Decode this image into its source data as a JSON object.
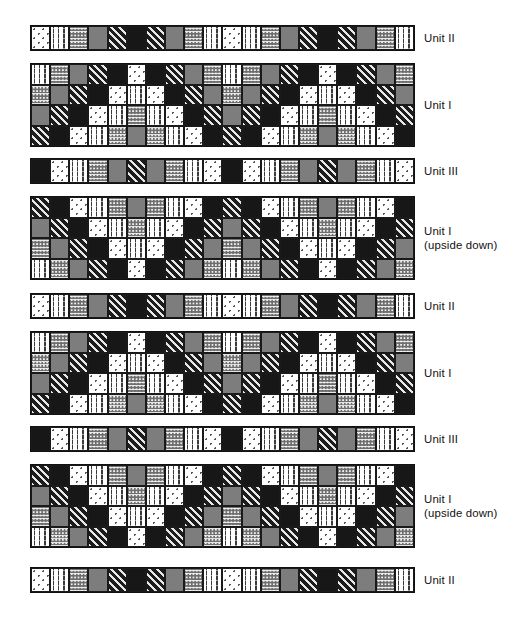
{
  "figure": {
    "title": "",
    "background_color": "#ffffff",
    "band_border_color": "#111111"
  },
  "legend": {
    "patterns": [
      {
        "key": "dotw",
        "name": "white-with-dots",
        "color": "#ffffff"
      },
      {
        "key": "wave",
        "name": "white-with-wavy-lines",
        "color": "#ffffff"
      },
      {
        "key": "dotd",
        "name": "dark-stipple-dots",
        "color": "#6e6e6e"
      },
      {
        "key": "gray",
        "name": "solid-gray",
        "color": "#7d7d7d"
      },
      {
        "key": "diag",
        "name": "dark-diagonal-stripes",
        "color": "#1c1c1c"
      },
      {
        "key": "blk",
        "name": "solid-black",
        "color": "#171717"
      }
    ]
  },
  "layout": {
    "band_left": 30,
    "band_width": 385,
    "label_left": 424,
    "cell_size": 19.25,
    "columns": 20
  },
  "bands": [
    {
      "id": "band-1",
      "label": "Unit II",
      "label_lines": "Unit II",
      "rows": 1,
      "top": 25,
      "height": 26,
      "grid": [
        [
          "dotw",
          "wave",
          "dotd",
          "gray",
          "diag",
          "blk",
          "diag",
          "gray",
          "dotd",
          "wave",
          "dotw",
          "wave",
          "dotd",
          "gray",
          "diag",
          "blk",
          "diag",
          "gray",
          "dotd",
          "wave"
        ]
      ]
    },
    {
      "id": "band-2",
      "label": "Unit I",
      "label_lines": "Unit I",
      "rows": 4,
      "top": 63,
      "height": 84,
      "grid": [
        [
          "wave",
          "dotd",
          "gray",
          "diag",
          "blk",
          "dotw",
          "blk",
          "diag",
          "gray",
          "dotd",
          "wave",
          "dotd",
          "gray",
          "diag",
          "blk",
          "dotw",
          "blk",
          "diag",
          "gray",
          "dotd"
        ],
        [
          "dotd",
          "gray",
          "diag",
          "blk",
          "dotw",
          "wave",
          "dotw",
          "blk",
          "diag",
          "gray",
          "dotd",
          "gray",
          "diag",
          "blk",
          "dotw",
          "wave",
          "dotw",
          "blk",
          "diag",
          "gray"
        ],
        [
          "gray",
          "diag",
          "blk",
          "dotw",
          "wave",
          "dotd",
          "wave",
          "dotw",
          "blk",
          "diag",
          "gray",
          "diag",
          "blk",
          "dotw",
          "wave",
          "dotd",
          "wave",
          "dotw",
          "blk",
          "diag"
        ],
        [
          "diag",
          "blk",
          "dotw",
          "wave",
          "dotd",
          "gray",
          "dotd",
          "wave",
          "dotw",
          "blk",
          "diag",
          "blk",
          "dotw",
          "wave",
          "dotd",
          "gray",
          "dotd",
          "wave",
          "dotw",
          "blk"
        ]
      ]
    },
    {
      "id": "band-3",
      "label": "Unit III",
      "label_lines": "Unit III",
      "rows": 1,
      "top": 158,
      "height": 26,
      "grid": [
        [
          "blk",
          "dotw",
          "wave",
          "dotd",
          "gray",
          "diag",
          "gray",
          "dotd",
          "wave",
          "dotw",
          "blk",
          "dotw",
          "wave",
          "dotd",
          "gray",
          "diag",
          "gray",
          "dotd",
          "wave",
          "dotw"
        ]
      ]
    },
    {
      "id": "band-4",
      "label": "Unit I (upside down)",
      "label_lines": "Unit I\n(upside down)",
      "rows": 4,
      "top": 196,
      "height": 84,
      "grid": [
        [
          "diag",
          "blk",
          "dotw",
          "wave",
          "dotd",
          "gray",
          "dotd",
          "wave",
          "dotw",
          "blk",
          "diag",
          "blk",
          "dotw",
          "wave",
          "dotd",
          "gray",
          "dotd",
          "wave",
          "dotw",
          "blk"
        ],
        [
          "gray",
          "diag",
          "blk",
          "dotw",
          "wave",
          "dotd",
          "wave",
          "dotw",
          "blk",
          "diag",
          "gray",
          "diag",
          "blk",
          "dotw",
          "wave",
          "dotd",
          "wave",
          "dotw",
          "blk",
          "diag"
        ],
        [
          "dotd",
          "gray",
          "diag",
          "blk",
          "dotw",
          "wave",
          "dotw",
          "blk",
          "diag",
          "gray",
          "dotd",
          "gray",
          "diag",
          "blk",
          "dotw",
          "wave",
          "dotw",
          "blk",
          "diag",
          "gray"
        ],
        [
          "wave",
          "dotd",
          "gray",
          "diag",
          "blk",
          "dotw",
          "blk",
          "diag",
          "gray",
          "dotd",
          "wave",
          "dotd",
          "gray",
          "diag",
          "blk",
          "dotw",
          "blk",
          "diag",
          "gray",
          "dotd"
        ]
      ]
    },
    {
      "id": "band-5",
      "label": "Unit II",
      "label_lines": "Unit II",
      "rows": 1,
      "top": 293,
      "height": 26,
      "grid": [
        [
          "dotw",
          "wave",
          "dotd",
          "gray",
          "diag",
          "blk",
          "diag",
          "gray",
          "dotd",
          "wave",
          "dotw",
          "wave",
          "dotd",
          "gray",
          "diag",
          "blk",
          "diag",
          "gray",
          "dotd",
          "wave"
        ]
      ]
    },
    {
      "id": "band-6",
      "label": "Unit I",
      "label_lines": "Unit I",
      "rows": 4,
      "top": 331,
      "height": 84,
      "grid": [
        [
          "wave",
          "dotd",
          "gray",
          "diag",
          "blk",
          "dotw",
          "blk",
          "diag",
          "gray",
          "dotd",
          "wave",
          "dotd",
          "gray",
          "diag",
          "blk",
          "dotw",
          "blk",
          "diag",
          "gray",
          "dotd"
        ],
        [
          "dotd",
          "gray",
          "diag",
          "blk",
          "dotw",
          "wave",
          "dotw",
          "blk",
          "diag",
          "gray",
          "dotd",
          "gray",
          "diag",
          "blk",
          "dotw",
          "wave",
          "dotw",
          "blk",
          "diag",
          "gray"
        ],
        [
          "gray",
          "diag",
          "blk",
          "dotw",
          "wave",
          "dotd",
          "wave",
          "dotw",
          "blk",
          "diag",
          "gray",
          "diag",
          "blk",
          "dotw",
          "wave",
          "dotd",
          "wave",
          "dotw",
          "blk",
          "diag"
        ],
        [
          "diag",
          "blk",
          "dotw",
          "wave",
          "dotd",
          "gray",
          "dotd",
          "wave",
          "dotw",
          "blk",
          "diag",
          "blk",
          "dotw",
          "wave",
          "dotd",
          "gray",
          "dotd",
          "wave",
          "dotw",
          "blk"
        ]
      ]
    },
    {
      "id": "band-7",
      "label": "Unit III",
      "label_lines": "Unit III",
      "rows": 1,
      "top": 426,
      "height": 26,
      "grid": [
        [
          "blk",
          "dotw",
          "wave",
          "dotd",
          "gray",
          "diag",
          "gray",
          "dotd",
          "wave",
          "dotw",
          "blk",
          "dotw",
          "wave",
          "dotd",
          "gray",
          "diag",
          "gray",
          "dotd",
          "wave",
          "dotw"
        ]
      ]
    },
    {
      "id": "band-8",
      "label": "Unit I (upside down)",
      "label_lines": "Unit I\n(upside down)",
      "rows": 4,
      "top": 464,
      "height": 84,
      "grid": [
        [
          "diag",
          "blk",
          "dotw",
          "wave",
          "dotd",
          "gray",
          "dotd",
          "wave",
          "dotw",
          "blk",
          "diag",
          "blk",
          "dotw",
          "wave",
          "dotd",
          "gray",
          "dotd",
          "wave",
          "dotw",
          "blk"
        ],
        [
          "gray",
          "diag",
          "blk",
          "dotw",
          "wave",
          "dotd",
          "wave",
          "dotw",
          "blk",
          "diag",
          "gray",
          "diag",
          "blk",
          "dotw",
          "wave",
          "dotd",
          "wave",
          "dotw",
          "blk",
          "diag"
        ],
        [
          "dotd",
          "gray",
          "diag",
          "blk",
          "dotw",
          "wave",
          "dotw",
          "blk",
          "diag",
          "gray",
          "dotd",
          "gray",
          "diag",
          "blk",
          "dotw",
          "wave",
          "dotw",
          "blk",
          "diag",
          "gray"
        ],
        [
          "wave",
          "dotd",
          "gray",
          "diag",
          "blk",
          "dotw",
          "blk",
          "diag",
          "gray",
          "dotd",
          "wave",
          "dotd",
          "gray",
          "diag",
          "blk",
          "dotw",
          "blk",
          "diag",
          "gray",
          "dotd"
        ]
      ]
    },
    {
      "id": "band-9",
      "label": "Unit II",
      "label_lines": "Unit II",
      "rows": 1,
      "top": 567,
      "height": 26,
      "grid": [
        [
          "dotw",
          "wave",
          "dotd",
          "gray",
          "diag",
          "blk",
          "diag",
          "gray",
          "dotd",
          "wave",
          "dotw",
          "wave",
          "dotd",
          "gray",
          "diag",
          "blk",
          "diag",
          "gray",
          "dotd",
          "wave"
        ]
      ]
    }
  ]
}
